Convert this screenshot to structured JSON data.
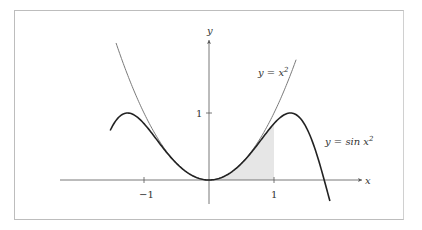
{
  "figure": {
    "axis_labels": {
      "x": "x",
      "y": "y"
    },
    "ticks": {
      "x_neg1": "−1",
      "x_1": "1",
      "y_1": "1"
    },
    "curve_labels": {
      "parabola": {
        "lhs": "y = x",
        "sup": "2"
      },
      "sine": {
        "lhs": "y = sin x",
        "sup": "2"
      }
    },
    "colors": {
      "parabola": "#7a7a7a",
      "sine": "#222222",
      "shade": "#e6e6e6",
      "axis": "#555555"
    }
  },
  "chart_data": {
    "type": "line",
    "title": "",
    "xlabel": "x",
    "ylabel": "y",
    "xticks": [
      -1,
      1
    ],
    "yticks": [
      1
    ],
    "xlim": [
      -2.3,
      2.4
    ],
    "ylim": [
      -0.4,
      2.1
    ],
    "series": [
      {
        "name": "y = x^2",
        "domain": [
          -1.43,
          1.34
        ],
        "expression": "x^2"
      },
      {
        "name": "y = sin x^2",
        "domain": [
          -1.52,
          1.86
        ],
        "expression": "sin(x^2)"
      }
    ],
    "shaded_region": {
      "under": "sin x^2",
      "from": 0,
      "to": 1
    },
    "grid": false,
    "legend": "inline labels"
  }
}
